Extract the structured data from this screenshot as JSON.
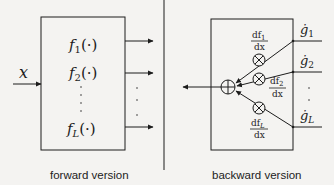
{
  "forward": {
    "input_label": "x",
    "functions": [
      {
        "name": "f",
        "sub": "1",
        "arg": "(·)"
      },
      {
        "name": "f",
        "sub": "2",
        "arg": "(·)"
      },
      {
        "name": "f",
        "sub": "L",
        "arg": "(·)"
      }
    ],
    "caption": "forward version"
  },
  "backward": {
    "inputs": [
      {
        "name": "ġ",
        "sub": "1"
      },
      {
        "name": "ġ",
        "sub": "2"
      },
      {
        "name": "ġ",
        "sub": "L"
      }
    ],
    "derivatives": [
      {
        "num": "df",
        "sub": "1",
        "den": "dx"
      },
      {
        "num": "df",
        "sub": "2",
        "den": "dx"
      },
      {
        "num": "df",
        "sub": "L",
        "den": "dx"
      }
    ],
    "caption": "backward version"
  },
  "colors": {
    "line": "#1c1c1c",
    "background": "#f4f3f1"
  }
}
